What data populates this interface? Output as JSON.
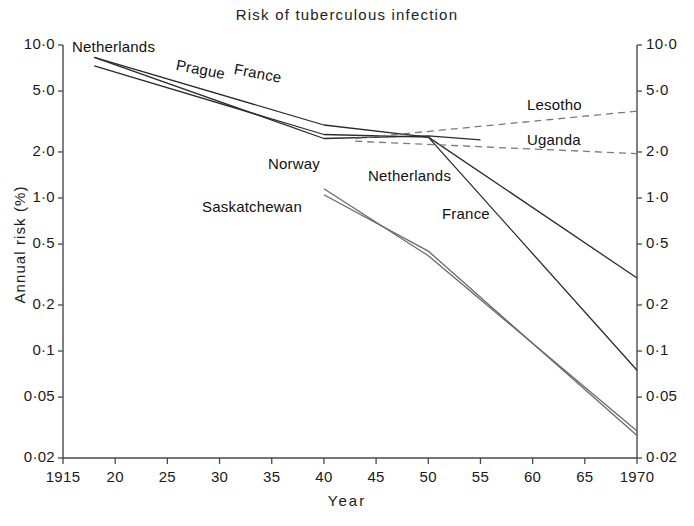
{
  "chart_data": {
    "type": "line",
    "title": "Risk  of  tuberculous  infection",
    "xlabel": "Year",
    "ylabel": "Annual  risk  (%)",
    "xlim": [
      1915,
      1970
    ],
    "ylim": [
      0.02,
      10.0
    ],
    "yscale": "log",
    "grid": false,
    "legend_position": "inline-labels",
    "xticks": [
      {
        "value": 1915,
        "label": "1915"
      },
      {
        "value": 1920,
        "label": "20"
      },
      {
        "value": 1925,
        "label": "25"
      },
      {
        "value": 1930,
        "label": "30"
      },
      {
        "value": 1935,
        "label": "35"
      },
      {
        "value": 1940,
        "label": "40"
      },
      {
        "value": 1945,
        "label": "45"
      },
      {
        "value": 1950,
        "label": "50"
      },
      {
        "value": 1955,
        "label": "55"
      },
      {
        "value": 1960,
        "label": "60"
      },
      {
        "value": 1965,
        "label": "65"
      },
      {
        "value": 1970,
        "label": "1970"
      }
    ],
    "yticks": [
      {
        "value": 10.0,
        "label": "10·0"
      },
      {
        "value": 5.0,
        "label": "5·0"
      },
      {
        "value": 2.0,
        "label": "2·0"
      },
      {
        "value": 1.0,
        "label": "1·0"
      },
      {
        "value": 0.5,
        "label": "0·5"
      },
      {
        "value": 0.2,
        "label": "0·2"
      },
      {
        "value": 0.1,
        "label": "0·1"
      },
      {
        "value": 0.05,
        "label": "0·05"
      },
      {
        "value": 0.02,
        "label": "0·02"
      }
    ],
    "series": [
      {
        "name": "Netherlands",
        "style": "solid",
        "color": "#2b2b2b",
        "x": [
          1918,
          1940,
          1950,
          1970
        ],
        "y": [
          7.3,
          2.6,
          2.5,
          0.075
        ]
      },
      {
        "name": "Prague",
        "style": "solid",
        "color": "#2b2b2b",
        "x": [
          1918,
          1940,
          1950,
          1955
        ],
        "y": [
          8.3,
          2.45,
          2.55,
          2.4
        ]
      },
      {
        "name": "France",
        "style": "solid",
        "color": "#2b2b2b",
        "x": [
          1918,
          1940,
          1950,
          1970
        ],
        "y": [
          8.3,
          3.0,
          2.5,
          0.3
        ]
      },
      {
        "name": "Norway",
        "style": "solid",
        "color": "#6a6a6a",
        "x": [
          1940,
          1950,
          1970
        ],
        "y": [
          1.15,
          0.42,
          0.03
        ]
      },
      {
        "name": "Saskatchewan",
        "style": "solid",
        "color": "#6a6a6a",
        "x": [
          1940,
          1950,
          1970
        ],
        "y": [
          1.05,
          0.45,
          0.028
        ]
      },
      {
        "name": "Lesotho",
        "style": "dashed",
        "color": "#7a7a7a",
        "x": [
          1943,
          1970
        ],
        "y": [
          2.45,
          3.7
        ]
      },
      {
        "name": "Uganda",
        "style": "dashed",
        "color": "#7a7a7a",
        "x": [
          1943,
          1970
        ],
        "y": [
          2.35,
          1.95
        ]
      }
    ],
    "annotations": [
      {
        "name": "Netherlands",
        "text": "Netherlands",
        "x": 72,
        "y": 38,
        "rotate": 0
      },
      {
        "name": "Prague",
        "text": "Prague",
        "x": 178,
        "y": 56,
        "rotate": 11
      },
      {
        "name": "France",
        "text": "France",
        "x": 236,
        "y": 60,
        "rotate": 11
      },
      {
        "name": "Lesotho",
        "text": "Lesotho",
        "x": 527,
        "y": 96,
        "rotate": 0
      },
      {
        "name": "Uganda",
        "text": "Uganda",
        "x": 527,
        "y": 131,
        "rotate": 0
      },
      {
        "name": "Norway",
        "text": "Norway",
        "x": 268,
        "y": 155,
        "rotate": 0
      },
      {
        "name": "Netherlands-lower",
        "text": "Netherlands",
        "x": 368,
        "y": 167,
        "rotate": 0
      },
      {
        "name": "Saskatchewan",
        "text": "Saskatchewan",
        "x": 202,
        "y": 198,
        "rotate": 0
      },
      {
        "name": "France-lower",
        "text": "France",
        "x": 442,
        "y": 205,
        "rotate": 0
      }
    ]
  }
}
